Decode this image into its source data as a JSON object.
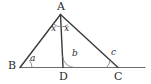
{
  "figure": {
    "kind": "geometry-diagram",
    "width": 151,
    "height": 84,
    "background_color": "#ffffff",
    "stroke_color": "#3a3a3a",
    "baseline_color": "#6b6b6b",
    "arc_color": "#6b6b6b",
    "text_color": "#2b2b2b"
  },
  "points": [
    {
      "id": "A",
      "label": "A",
      "x": 60.5,
      "y": 14.5,
      "label_x": 57,
      "label_y": 2
    },
    {
      "id": "B",
      "label": "B",
      "x": 20.0,
      "y": 67.5,
      "label_x": 8,
      "label_y": 61
    },
    {
      "id": "D",
      "label": "D",
      "x": 63.0,
      "y": 67.5,
      "label_x": 59,
      "label_y": 71
    },
    {
      "id": "C",
      "label": "C",
      "x": 118.0,
      "y": 67.5,
      "label_x": 114,
      "label_y": 71
    },
    {
      "id": "E",
      "label": "",
      "x": 145.0,
      "y": 67.5,
      "label_x": 0,
      "label_y": 0
    }
  ],
  "segments": [
    {
      "id": "AB",
      "from": "A",
      "to": "B",
      "kind": "side",
      "width": 1.4
    },
    {
      "id": "AC",
      "from": "A",
      "to": "C",
      "kind": "side",
      "width": 1.4
    },
    {
      "id": "AD",
      "from": "A",
      "to": "D",
      "kind": "cevian",
      "width": 1.4
    },
    {
      "id": "BE",
      "from": "B",
      "to": "E",
      "kind": "baseline-extended",
      "width": 1.2
    }
  ],
  "angles": [
    {
      "id": "angle-BAD",
      "label": "x",
      "at": "A",
      "label_x": 51,
      "label_y": 24
    },
    {
      "id": "angle-DAC",
      "label": "x",
      "at": "A",
      "label_x": 64,
      "label_y": 24
    },
    {
      "id": "angle-ABD",
      "label": "a",
      "at": "B",
      "label_x": 30,
      "label_y": 54
    },
    {
      "id": "angle-ADC",
      "label": "b",
      "at": "D",
      "label_x": 72,
      "label_y": 50
    },
    {
      "id": "angle-ACB",
      "label": "c",
      "at": "C",
      "label_x": 111,
      "label_y": 49
    }
  ]
}
